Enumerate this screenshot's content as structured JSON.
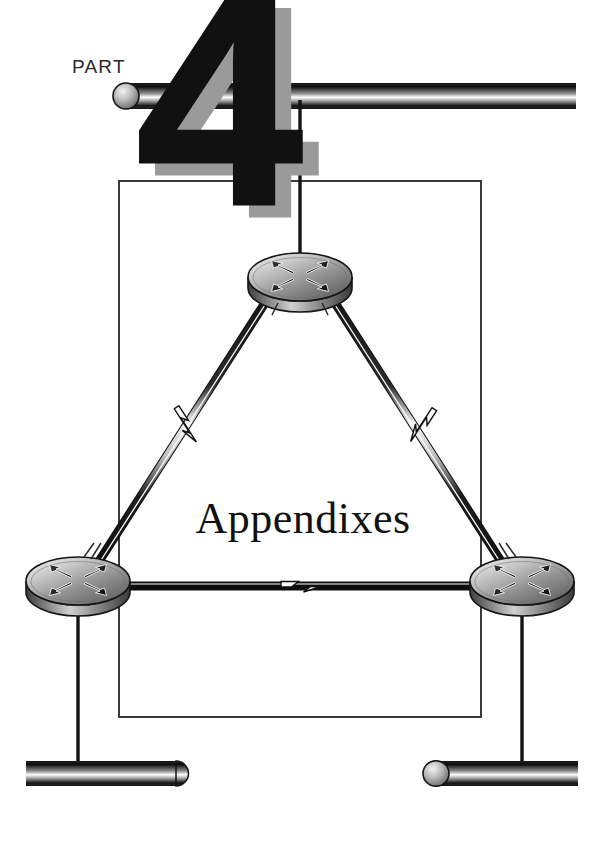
{
  "page": {
    "part_label": "PART",
    "part_number": "4",
    "title": "Appendixes",
    "width": 606,
    "height": 847,
    "background_color": "#ffffff"
  },
  "colors": {
    "ink": "#111111",
    "numeral_shadow": "#9a9a9a",
    "frame_border": "#3a3a3a",
    "cable_dark": "#1a1a1a",
    "cable_highlight": "#ffffff",
    "device_body_light": "#e8e8e8",
    "device_body_mid": "#9c9c9c",
    "device_body_dark": "#4a4a4a",
    "bus_light": "#f2f2f2",
    "bus_dark": "#141414"
  },
  "frame": {
    "name": "content-frame",
    "x": 119,
    "y": 181,
    "width": 362,
    "height": 536,
    "stroke_width": 2
  },
  "network_diagram": {
    "type": "diagram",
    "topology": "triangle",
    "devices": [
      {
        "id": "router-top",
        "icon": "router-icon",
        "label": "",
        "cx": 300,
        "cy": 277,
        "rx": 52,
        "ry": 24
      },
      {
        "id": "router-bottom-left",
        "icon": "router-icon",
        "label": "",
        "cx": 78,
        "cy": 581,
        "rx": 52,
        "ry": 24
      },
      {
        "id": "router-bottom-right",
        "icon": "router-icon",
        "label": "",
        "cx": 522,
        "cy": 581,
        "rx": 52,
        "ry": 24
      }
    ],
    "segments": [
      {
        "id": "ethernet-top",
        "icon": "ethernet-bus-icon",
        "x1": 126,
        "x2": 576,
        "y": 96,
        "cap": "left"
      },
      {
        "id": "ethernet-bottom-left",
        "icon": "ethernet-bus-icon",
        "x1": 28,
        "x2": 180,
        "y": 773,
        "cap": "right"
      },
      {
        "id": "ethernet-bottom-right",
        "icon": "ethernet-bus-icon",
        "x1": 424,
        "x2": 578,
        "y": 773,
        "cap": "left"
      }
    ],
    "links": [
      {
        "id": "link-top-to-ethernet",
        "style": "thin-line",
        "from": "ethernet-top",
        "to": "router-top",
        "serial_bolt": false
      },
      {
        "id": "link-top-to-bottom-left",
        "style": "serial-tube",
        "from": "router-top",
        "to": "router-bottom-left",
        "serial_bolt": true,
        "bolt_icon": "lightning-bolt-icon"
      },
      {
        "id": "link-top-to-bottom-right",
        "style": "serial-tube",
        "from": "router-top",
        "to": "router-bottom-right",
        "serial_bolt": true,
        "bolt_icon": "lightning-bolt-icon"
      },
      {
        "id": "link-bottom-left-to-bottom-right",
        "style": "serial-tube",
        "from": "router-bottom-left",
        "to": "router-bottom-right",
        "serial_bolt": true,
        "bolt_icon": "lightning-bolt-icon"
      },
      {
        "id": "link-bottom-left-to-ethernet",
        "style": "thin-line",
        "from": "router-bottom-left",
        "to": "ethernet-bottom-left",
        "serial_bolt": false
      },
      {
        "id": "link-bottom-right-to-ethernet",
        "style": "thin-line",
        "from": "router-bottom-right",
        "to": "ethernet-bottom-right",
        "serial_bolt": false
      }
    ]
  }
}
